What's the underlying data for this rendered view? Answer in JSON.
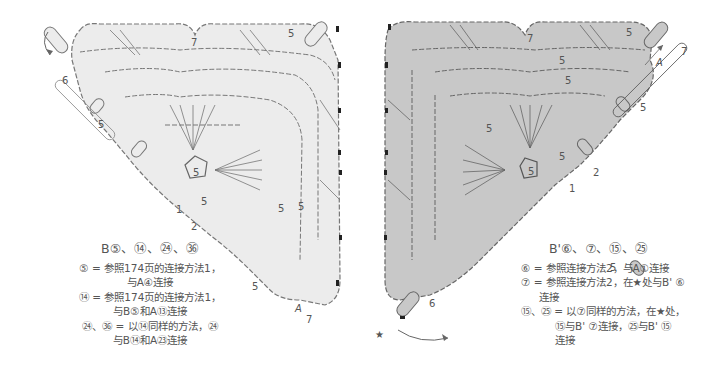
{
  "left_chart": {
    "name": "Motif B",
    "numbers": [
      "7",
      "5",
      "6",
      "5",
      "5",
      "5",
      "5",
      "5",
      "1",
      "2",
      "5",
      "7"
    ],
    "marker_a": "A",
    "fill_color": "#ececec"
  },
  "right_chart": {
    "name": "Motif B'",
    "numbers": [
      "7",
      "5",
      "5",
      "5",
      "7",
      "5",
      "5",
      "5",
      "5",
      "2",
      "1",
      "5",
      "6"
    ],
    "marker_a": "A",
    "star": "★",
    "fill_color": "#c8c8c8"
  },
  "legend_left": {
    "title": "B⑤、⑭、㉔、㊱",
    "rows": [
      "⑤ = 参照174页的连接方法1，",
      "与A④连接",
      "⑭ = 参照174页的连接方法1，",
      "与B⑤和A⑬连接",
      "㉔、㊱ = 以⑭同样的方法，㉔",
      "与B⑭和A㉓连接"
    ]
  },
  "legend_right": {
    "title": "B'⑥、⑦、⑮、㉕",
    "rows": [
      "⑥ = 参照连接方法2，与A①连接",
      "⑦ = 参照连接方法2，在★处与B' ⑥",
      "连接",
      "⑮、㉕ = 以⑦同样的方法，在★处，",
      "⑮与B' ⑦连接，㉕与B' ⑮",
      "连接"
    ]
  }
}
